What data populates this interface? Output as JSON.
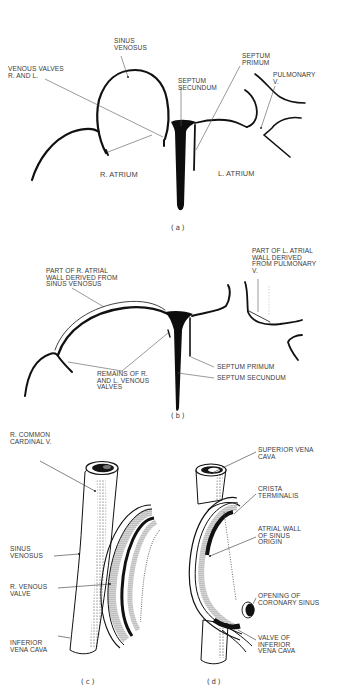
{
  "figure": {
    "colors": {
      "ink": "#111111",
      "leader": "#555555",
      "text": "#3a3a3a",
      "background": "#ffffff"
    },
    "panels": [
      {
        "id": "a",
        "caption": "(a)",
        "labels": {
          "sinus_venosus": "SINUS\nVENOSUS",
          "venous_valves": "VENOUS VALVES\nR. AND L.",
          "septum_secundum": "SEPTUM\nSECUNDUM",
          "septum_primum": "SEPTUM\nPRIMUM",
          "pulmonary_v": "PULMONARY\nV.",
          "r_atrium": "R. ATRIUM",
          "l_atrium": "L. ATRIUM"
        }
      },
      {
        "id": "b",
        "caption": "(b)",
        "labels": {
          "r_atrial_wall": "PART OF R. ATRIAL\nWALL DERIVED FROM\nSINUS VENOSUS",
          "l_atrial_wall": "PART OF L. ATRIAL\nWALL DERIVED\nFROM PULMONARY\nV.",
          "remains_valves": "REMAINS OF R.\nAND L. VENOUS\nVALVES",
          "septum_primum": "SEPTUM PRIMUM",
          "septum_secundum": "SEPTUM SECUNDUM"
        }
      },
      {
        "id": "c",
        "caption": "(c)",
        "labels": {
          "r_common_cardinal": "R. COMMON\nCARDINAL V.",
          "sinus_venosus": "SINUS\nVENOSUS",
          "r_venous_valve": "R. VENOUS\nVALVE",
          "inferior_vena_cava": "INFERIOR\nVENA CAVA"
        }
      },
      {
        "id": "d",
        "caption": "(d)",
        "labels": {
          "superior_vena_cava": "SUPERIOR VENA\nCAVA",
          "crista_terminalis": "CRISTA\nTERMINALIS",
          "atrial_wall_sinus": "ATRIAL WALL\nOF SINUS\nORIGIN",
          "coronary_sinus": "OPENING OF\nCORONARY SINUS",
          "valve_ivc": "VALVE OF\nINFERIOR\nVENA CAVA"
        }
      }
    ]
  }
}
